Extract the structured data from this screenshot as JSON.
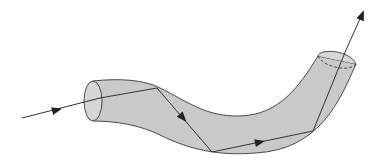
{
  "diagram": {
    "title": "",
    "colors": {
      "fiber_fill": "#c9c9c9",
      "fiber_end_fill": "#d6d6d6",
      "outline": "#4a4a4a",
      "ray": "#333333",
      "background": "#ffffff"
    },
    "ray_points": [
      [
        22,
        118
      ],
      [
        100,
        98
      ],
      [
        157,
        88
      ],
      [
        212,
        152
      ],
      [
        313,
        131
      ],
      [
        346,
        50
      ],
      [
        363,
        12
      ]
    ],
    "arrows": [
      {
        "x": 57,
        "y": 110,
        "angle": -14
      },
      {
        "x": 183,
        "y": 118,
        "angle": 49
      },
      {
        "x": 260,
        "y": 142,
        "angle": -12
      },
      {
        "x": 363,
        "y": 12,
        "angle": -68
      }
    ]
  }
}
